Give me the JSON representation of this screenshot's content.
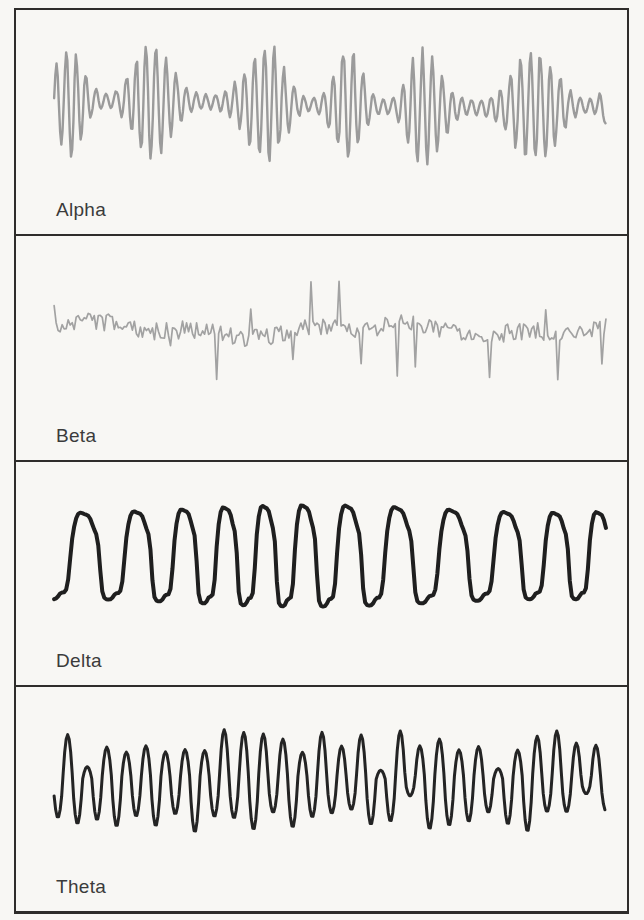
{
  "figure": {
    "title_hidden": "",
    "background_color": "#f8f7f4",
    "frame_color": "#2f2d2b",
    "label_color": "#3b3b3b",
    "panels": [
      {
        "label": "Alpha",
        "wave": "alpha",
        "description": "medium-frequency gray trace with waxing-waning spindle bursts",
        "color": "#9b9b9b",
        "stroke_width": 2.4,
        "seed": 7,
        "cycle_px": 9.8,
        "amp_px": 55
      },
      {
        "label": "Beta",
        "wave": "beta",
        "description": "high-frequency low-amplitude noisy gray trace with sporadic spikes",
        "color": "#a2a2a2",
        "stroke_width": 1.7,
        "seed": 13,
        "cycle_px": 4,
        "amp_px": 9,
        "spike_px": 34
      },
      {
        "label": "Delta",
        "wave": "delta",
        "description": "slow large-amplitude black waves with flattened irregular crests",
        "color": "#1f1f1f",
        "stroke_width": 4,
        "seed": 3,
        "cycle_px": 47,
        "amp_px": 47
      },
      {
        "label": "Theta",
        "wave": "theta",
        "description": "regular sharp black oscillations of moderate amplitude with occasional shallow notches",
        "color": "#242424",
        "stroke_width": 3,
        "seed": 5,
        "cycle_px": 19.5,
        "amp_px": 46
      }
    ]
  }
}
